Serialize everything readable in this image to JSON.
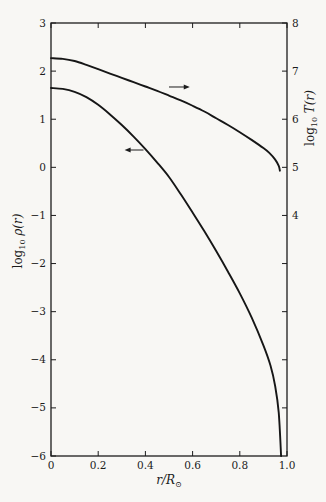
{
  "chart_data": {
    "type": "line",
    "title": "",
    "x_axis": {
      "title_parts": {
        "var": "r/R",
        "sub": "⊙"
      },
      "range": [
        0,
        1.0
      ],
      "ticks": [
        {
          "v": 0.0,
          "label": "0"
        },
        {
          "v": 0.2,
          "label": "0.2"
        },
        {
          "v": 0.4,
          "label": "0.4"
        },
        {
          "v": 0.6,
          "label": "0.6"
        },
        {
          "v": 0.8,
          "label": "0.8"
        },
        {
          "v": 1.0,
          "label": "1.0"
        }
      ],
      "mirror_top_ticks": true
    },
    "y_left": {
      "title_parts": {
        "log": "log",
        "sub": "10",
        "var": " ρ(r)"
      },
      "range": [
        3,
        -6
      ],
      "ticks": [
        {
          "v": 3,
          "label": "3"
        },
        {
          "v": 2,
          "label": "2"
        },
        {
          "v": 1,
          "label": "1"
        },
        {
          "v": 0,
          "label": "0"
        },
        {
          "v": -1,
          "label": "−1"
        },
        {
          "v": -2,
          "label": "−2"
        },
        {
          "v": -3,
          "label": "−3"
        },
        {
          "v": -4,
          "label": "−4"
        },
        {
          "v": -5,
          "label": "−5"
        },
        {
          "v": -6,
          "label": "−6"
        }
      ]
    },
    "y_right": {
      "title_parts": {
        "log": "log",
        "sub": "10",
        "var": " T(r)"
      },
      "range": [
        8,
        -1
      ],
      "ticks": [
        {
          "v": 8,
          "label": "8"
        },
        {
          "v": 7,
          "label": "7"
        },
        {
          "v": 6,
          "label": "6"
        },
        {
          "v": 5,
          "label": "5"
        },
        {
          "v": 4,
          "label": "4"
        },
        {
          "v": 3,
          "label": ""
        },
        {
          "v": 2,
          "label": ""
        },
        {
          "v": 1,
          "label": ""
        },
        {
          "v": 0,
          "label": ""
        }
      ]
    },
    "series": [
      {
        "name": "log10 T(r)",
        "axis": "right",
        "color": "#161616",
        "points": [
          [
            0.0,
            7.27
          ],
          [
            0.05,
            7.255
          ],
          [
            0.1,
            7.21
          ],
          [
            0.15,
            7.13
          ],
          [
            0.2,
            7.04
          ],
          [
            0.25,
            6.95
          ],
          [
            0.3,
            6.86
          ],
          [
            0.35,
            6.77
          ],
          [
            0.4,
            6.68
          ],
          [
            0.45,
            6.59
          ],
          [
            0.5,
            6.49
          ],
          [
            0.55,
            6.39
          ],
          [
            0.6,
            6.28
          ],
          [
            0.65,
            6.16
          ],
          [
            0.7,
            6.02
          ],
          [
            0.75,
            5.88
          ],
          [
            0.8,
            5.73
          ],
          [
            0.85,
            5.57
          ],
          [
            0.9,
            5.4
          ],
          [
            0.925,
            5.3
          ],
          [
            0.95,
            5.16
          ],
          [
            0.965,
            5.03
          ],
          [
            0.97,
            4.93
          ]
        ]
      },
      {
        "name": "log10 rho(r)",
        "axis": "left",
        "color": "#161616",
        "points": [
          [
            0.0,
            1.65
          ],
          [
            0.05,
            1.63
          ],
          [
            0.1,
            1.57
          ],
          [
            0.15,
            1.46
          ],
          [
            0.2,
            1.3
          ],
          [
            0.25,
            1.1
          ],
          [
            0.3,
            0.88
          ],
          [
            0.35,
            0.64
          ],
          [
            0.4,
            0.38
          ],
          [
            0.45,
            0.1
          ],
          [
            0.5,
            -0.2
          ],
          [
            0.55,
            -0.56
          ],
          [
            0.6,
            -0.94
          ],
          [
            0.65,
            -1.33
          ],
          [
            0.7,
            -1.74
          ],
          [
            0.75,
            -2.17
          ],
          [
            0.8,
            -2.62
          ],
          [
            0.85,
            -3.12
          ],
          [
            0.9,
            -3.7
          ],
          [
            0.93,
            -4.12
          ],
          [
            0.95,
            -4.55
          ],
          [
            0.965,
            -5.1
          ],
          [
            0.975,
            -6.0
          ]
        ]
      }
    ],
    "annotations": [
      {
        "type": "arrow",
        "name": "temperature-axis-arrow",
        "axis": "left",
        "from": [
          0.5,
          1.67
        ],
        "to": [
          0.588,
          1.67
        ]
      },
      {
        "type": "arrow",
        "name": "density-axis-arrow",
        "axis": "left",
        "from": [
          0.392,
          0.36
        ],
        "to": [
          0.312,
          0.36
        ]
      }
    ],
    "grid": false,
    "legend": "none",
    "frame_color": "#1c1c1c",
    "background": "#f8f7f4"
  }
}
